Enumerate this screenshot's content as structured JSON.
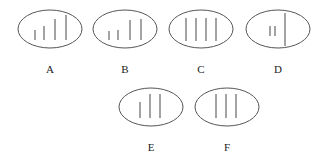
{
  "figure": {
    "panels": [
      {
        "label": "A",
        "cx": 50,
        "cy": 29,
        "rx": 32,
        "ry": 19,
        "label_y": 73,
        "lines": [
          {
            "x": 35,
            "y1": 30,
            "y2": 40
          },
          {
            "x": 44,
            "y1": 26,
            "y2": 40
          },
          {
            "x": 55,
            "y1": 19,
            "y2": 40
          },
          {
            "x": 66,
            "y1": 15,
            "y2": 40
          }
        ]
      },
      {
        "label": "B",
        "cx": 125,
        "cy": 29,
        "rx": 32,
        "ry": 19,
        "label_y": 73,
        "lines": [
          {
            "x": 109,
            "y1": 31,
            "y2": 40
          },
          {
            "x": 118,
            "y1": 30,
            "y2": 40
          },
          {
            "x": 130,
            "y1": 20,
            "y2": 40
          },
          {
            "x": 141,
            "y1": 19,
            "y2": 40
          }
        ]
      },
      {
        "label": "C",
        "cx": 201,
        "cy": 29,
        "rx": 32,
        "ry": 19,
        "label_y": 73,
        "lines": [
          {
            "x": 186,
            "y1": 18,
            "y2": 41
          },
          {
            "x": 196,
            "y1": 18,
            "y2": 41
          },
          {
            "x": 206,
            "y1": 18,
            "y2": 41
          },
          {
            "x": 216,
            "y1": 18,
            "y2": 41
          }
        ]
      },
      {
        "label": "D",
        "cx": 278,
        "cy": 29,
        "rx": 32,
        "ry": 19,
        "label_y": 73,
        "lines": [
          {
            "x": 270,
            "y1": 26,
            "y2": 36
          },
          {
            "x": 275,
            "y1": 26,
            "y2": 36
          },
          {
            "x": 285,
            "y1": 13,
            "y2": 46
          }
        ]
      },
      {
        "label": "E",
        "cx": 151,
        "cy": 107,
        "rx": 32,
        "ry": 19,
        "label_y": 151,
        "lines": [
          {
            "x": 140,
            "y1": 102,
            "y2": 118
          },
          {
            "x": 150,
            "y1": 94,
            "y2": 118
          },
          {
            "x": 160,
            "y1": 94,
            "y2": 118
          }
        ]
      },
      {
        "label": "F",
        "cx": 227,
        "cy": 107,
        "rx": 32,
        "ry": 19,
        "label_y": 151,
        "lines": [
          {
            "x": 216,
            "y1": 94,
            "y2": 118
          },
          {
            "x": 226,
            "y1": 94,
            "y2": 118
          },
          {
            "x": 236,
            "y1": 94,
            "y2": 118
          }
        ]
      }
    ]
  },
  "labels": {
    "a": "A",
    "b": "B",
    "c": "C",
    "d": "D",
    "e": "E",
    "f": "F"
  }
}
